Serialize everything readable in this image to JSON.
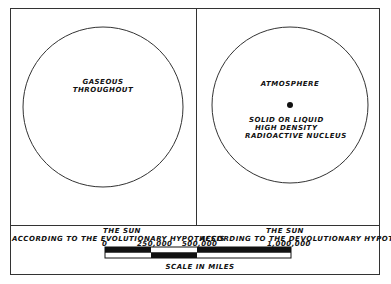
{
  "left_panel": {
    "circle_label_line1": "GASEOUS",
    "circle_label_line2": "THROUGHOUT",
    "caption_line1": "THE  SUN",
    "caption_line2": "ACCORDING TO THE EVOLUTIONARY HYPOTHESIS"
  },
  "right_panel": {
    "atmosphere_label": "ATMOSPHERE",
    "nucleus_line1": "SOLID OR LIQUID",
    "nucleus_line2": "HIGH DENSITY",
    "nucleus_line3": "RADIOACTIVE  NUCLEUS",
    "caption_line1": "THE  SUN",
    "caption_line2": "ACCORDING TO THE DEVOLUTIONARY HYPOTHESIS"
  },
  "scale_bar": {
    "ticks": [
      "0",
      "250,000",
      "500,000",
      "1,000,000"
    ],
    "title": "SCALE  IN  MILES"
  }
}
